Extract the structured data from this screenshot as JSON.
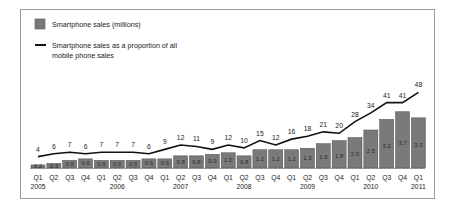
{
  "chart_data": {
    "type": "bar",
    "title": "",
    "xlabel": "",
    "ylabel": "",
    "legend_position": "top-left",
    "grid": false,
    "categories": [
      "Q1 2005",
      "Q2 2005",
      "Q3 2005",
      "Q4 2005",
      "Q1 2006",
      "Q2 2006",
      "Q3 2006",
      "Q4 2006",
      "Q1 2007",
      "Q2 2007",
      "Q3 2007",
      "Q4 2007",
      "Q1 2008",
      "Q2 2008",
      "Q3 2008",
      "Q4 2008",
      "Q1 2009",
      "Q2 2009",
      "Q3 2009",
      "Q4 2009",
      "Q1 2010",
      "Q2 2010",
      "Q3 2010",
      "Q4 2010",
      "Q1 2011"
    ],
    "quarter_labels": [
      "Q1",
      "Q2",
      "Q3",
      "Q4",
      "Q1",
      "Q2",
      "Q3",
      "Q4",
      "Q1",
      "Q2",
      "Q3",
      "Q4",
      "Q1",
      "Q2",
      "Q3",
      "Q4",
      "Q1",
      "Q2",
      "Q3",
      "Q4",
      "Q1",
      "Q2",
      "Q3",
      "Q4",
      "Q1"
    ],
    "year_labels": [
      {
        "index": 0,
        "label": "2005"
      },
      {
        "index": 5,
        "label": "2006"
      },
      {
        "index": 9,
        "label": "2007"
      },
      {
        "index": 13,
        "label": "2008"
      },
      {
        "index": 17,
        "label": "2009"
      },
      {
        "index": 21,
        "label": "2010"
      },
      {
        "index": 24,
        "label": "2011"
      }
    ],
    "series": [
      {
        "name": "Smartphone sales (millions)",
        "type": "bar",
        "color": "#7a7a7a",
        "values": [
          0.2,
          0.3,
          0.5,
          0.6,
          0.5,
          0.5,
          0.5,
          0.6,
          0.6,
          0.8,
          0.8,
          0.9,
          1.0,
          0.8,
          1.2,
          1.2,
          1.2,
          1.3,
          1.6,
          1.8,
          2.0,
          2.5,
          3.2,
          3.7,
          3.3
        ]
      },
      {
        "name": "Smartphone sales as a proportion of all mobile phone sales",
        "type": "line",
        "color": "#111111",
        "values": [
          4,
          6,
          7,
          6,
          7,
          7,
          7,
          6,
          9,
          12,
          11,
          9,
          12,
          10,
          15,
          12,
          16,
          18,
          21,
          20,
          28,
          34,
          41,
          41,
          48
        ]
      }
    ]
  },
  "legend": {
    "bar_label": "Smartphone sales (millions)",
    "line_label_1": "Smartphone sales as a proportion of all",
    "line_label_2": "mobile phone sales"
  }
}
